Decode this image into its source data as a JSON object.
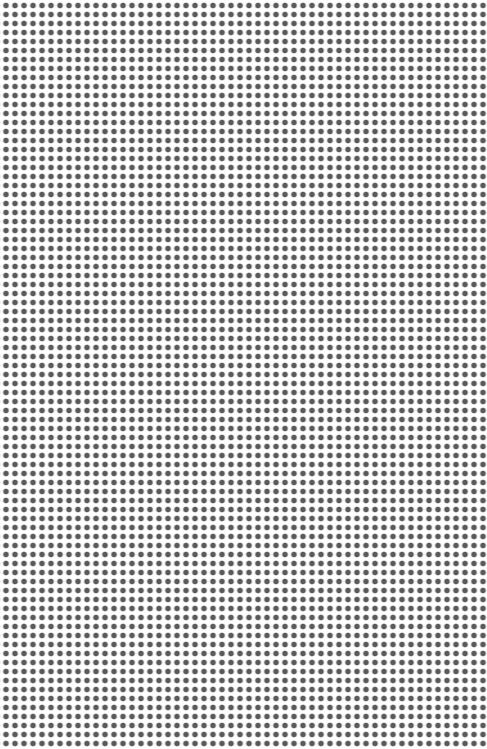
{
  "pattern": {
    "type": "dot-grid",
    "dot_color": "#5a5a5a",
    "background_color": "#ffffff",
    "pitch_px": 9,
    "dot_diameter_px": 5,
    "columns": 54,
    "rows": 83
  }
}
